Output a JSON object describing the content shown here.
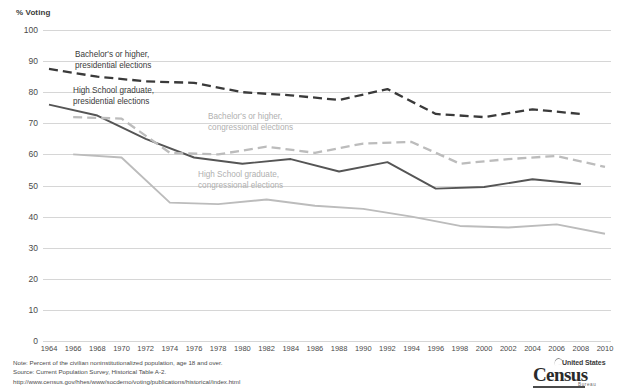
{
  "chart_data": {
    "type": "line",
    "title": "",
    "ylabel": "% Voting",
    "xlabel": "",
    "ylim": [
      0,
      100
    ],
    "ytick_values": [
      0,
      10,
      20,
      30,
      40,
      50,
      60,
      70,
      80,
      90,
      100
    ],
    "grid": true,
    "legend_position": "inline-annotations",
    "x": [
      1964,
      1966,
      1968,
      1970,
      1972,
      1974,
      1976,
      1978,
      1980,
      1982,
      1984,
      1986,
      1988,
      1990,
      1992,
      1994,
      1996,
      1998,
      2000,
      2002,
      2004,
      2006,
      2008,
      2010
    ],
    "series": [
      {
        "name": "Bachelor's or higher, presidential elections",
        "style": "dashed",
        "color": "#3a3a3a",
        "x": [
          1964,
          1968,
          1972,
          1976,
          1980,
          1984,
          1988,
          1992,
          1996,
          2000,
          2004,
          2008
        ],
        "values": [
          87.5,
          85.0,
          83.5,
          83.0,
          80.0,
          79.0,
          77.5,
          81.0,
          73.0,
          72.0,
          74.5,
          73.0
        ]
      },
      {
        "name": "High School graduate, presidential elections",
        "style": "solid",
        "color": "#555555",
        "x": [
          1964,
          1968,
          1972,
          1976,
          1980,
          1984,
          1988,
          1992,
          1996,
          2000,
          2004,
          2008
        ],
        "values": [
          76.0,
          72.5,
          65.0,
          59.0,
          57.0,
          58.5,
          54.5,
          57.5,
          49.0,
          49.5,
          52.0,
          50.5
        ]
      },
      {
        "name": "Bachelor's or higher, congressional elections",
        "style": "dashed",
        "color": "#bcbcbc",
        "x": [
          1966,
          1970,
          1974,
          1978,
          1982,
          1986,
          1990,
          1994,
          1998,
          2002,
          2006,
          2010
        ],
        "values": [
          72.0,
          71.5,
          60.5,
          60.0,
          62.5,
          60.5,
          63.5,
          64.0,
          57.0,
          58.5,
          59.5,
          56.0
        ]
      },
      {
        "name": "High School graduate, congressional elections",
        "style": "solid",
        "color": "#bcbcbc",
        "x": [
          1966,
          1970,
          1974,
          1978,
          1982,
          1986,
          1990,
          1994,
          1998,
          2002,
          2006,
          2010
        ],
        "values": [
          60.0,
          59.0,
          44.5,
          44.0,
          45.5,
          43.5,
          42.5,
          40.0,
          37.0,
          36.5,
          37.5,
          34.5
        ]
      }
    ],
    "annotations": [
      {
        "id": "ann1",
        "text_line1": "Bachelor's or higher,",
        "text_line2": "presidential elections",
        "tone": "dark"
      },
      {
        "id": "ann2",
        "text_line1": "High School graduate,",
        "text_line2": "presidential elections",
        "tone": "dark"
      },
      {
        "id": "ann3",
        "text_line1": "Bachelor's or higher,",
        "text_line2": "congressional elections",
        "tone": "light"
      },
      {
        "id": "ann4",
        "text_line1": "High School graduate,",
        "text_line2": "congressional elections",
        "tone": "light"
      }
    ]
  },
  "axis": {
    "y_title": "% Voting",
    "y_ticks": [
      "100",
      "90",
      "80",
      "70",
      "60",
      "50",
      "40",
      "30",
      "20",
      "10",
      "0"
    ],
    "x_ticks": [
      "1964",
      "1966",
      "1968",
      "1970",
      "1972",
      "1974",
      "1976",
      "1978",
      "1980",
      "1982",
      "1984",
      "1986",
      "1988",
      "1990",
      "1992",
      "1994",
      "1996",
      "1998",
      "2000",
      "2002",
      "2004",
      "2006",
      "2008",
      "2010"
    ]
  },
  "footer": {
    "note": "Note: Percent of the civilian noninstitutionalized population, age 18 and over.",
    "source": "Source: Current Population Survey, Historical Table A-2.",
    "url": "http://www.census.gov/hhes/www/socdemo/voting/publications/historical/index.html"
  },
  "logo": {
    "line1": "United States",
    "line2": "Census",
    "line3": "Bureau"
  },
  "colors": {
    "grid": "#d6d6d6",
    "dark_series": "#3a3a3a",
    "mid_series": "#555555",
    "light_series": "#bcbcbc",
    "text": "#4a4a4a"
  }
}
